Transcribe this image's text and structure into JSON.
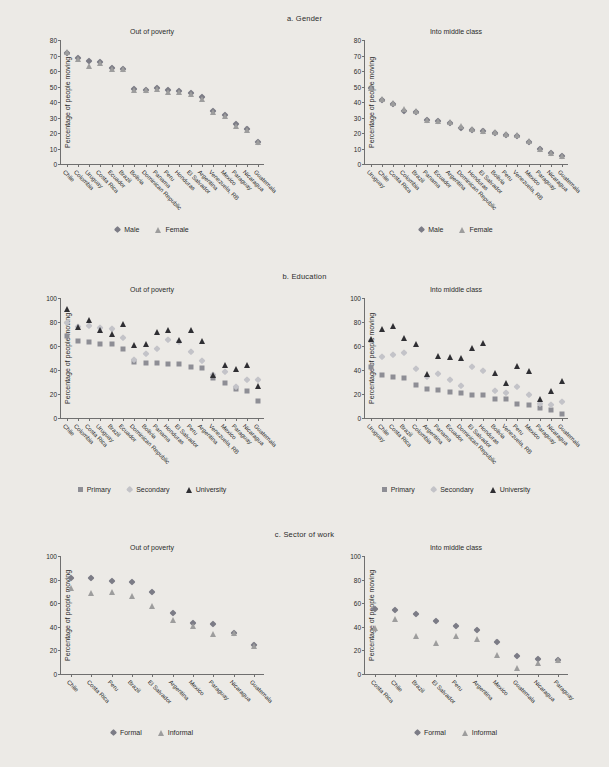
{
  "figure": {
    "background": "#eceae6",
    "marker_colors": {
      "male_diamond": "#7c7c86",
      "female_triangle": "#9d9d9d",
      "primary_square": "#8e8e95",
      "secondary_diamond": "#c3c3c8",
      "university_triangle": "#2f2f33",
      "formal_diamond": "#7c7c86",
      "informal_triangle": "#9d9d9d"
    }
  },
  "panels": [
    {
      "id": "a",
      "title": "a.  Gender",
      "legend": [
        {
          "label": "Male",
          "marker": "diamond"
        },
        {
          "label": "Female",
          "marker": "triangle"
        }
      ],
      "charts": [
        {
          "subtitle": "Out of poverty",
          "ylabel": "Percentage of people moving",
          "ylim": [
            0,
            80
          ],
          "yticks": [
            0,
            10,
            20,
            30,
            40,
            50,
            60,
            70,
            80
          ],
          "categories": [
            "Chile",
            "Colombia",
            "Uruguay",
            "Costa Rica",
            "Ecuador",
            "Brazil",
            "Bolivia",
            "Dominican Republic",
            "Panama",
            "Peru",
            "Honduras",
            "El Salvador",
            "Argentina",
            "Venezuela, RB",
            "Mexico",
            "Paraguay",
            "Nicaragua",
            "Guatemala"
          ],
          "series": [
            {
              "name": "Male",
              "marker": "diamond",
              "values": [
                71.5,
                68.5,
                66.5,
                65.5,
                62.0,
                61.5,
                48.5,
                48.0,
                49.0,
                47.5,
                47.0,
                45.5,
                43.0,
                34.0,
                31.5,
                26.0,
                22.5,
                14.5
              ]
            },
            {
              "name": "Female",
              "marker": "triangle",
              "values": [
                72.5,
                68.0,
                63.0,
                65.0,
                61.5,
                61.0,
                48.0,
                47.5,
                48.5,
                46.5,
                46.5,
                45.0,
                42.0,
                33.5,
                31.0,
                24.5,
                22.0,
                14.0
              ]
            }
          ]
        },
        {
          "subtitle": "Into middle class",
          "ylabel": "Percentage of people moving",
          "ylim": [
            0,
            80
          ],
          "yticks": [
            0,
            10,
            20,
            30,
            40,
            50,
            60,
            70,
            80
          ],
          "categories": [
            "Uruguay",
            "Chile",
            "Costa Rica",
            "Colombia",
            "Brazil",
            "Panama",
            "Ecuador",
            "Argentina",
            "Dominican Republic",
            "Honduras",
            "El Salvador",
            "Bolivia",
            "Peru",
            "Venezuela, RB",
            "Mexico",
            "Paraguay",
            "Nicaragua",
            "Guatemala"
          ],
          "series": [
            {
              "name": "Male",
              "marker": "diamond",
              "values": [
                49.0,
                41.5,
                39.0,
                34.5,
                33.5,
                28.5,
                27.5,
                26.5,
                23.5,
                22.0,
                21.0,
                20.0,
                19.0,
                18.0,
                14.5,
                9.5,
                7.0,
                5.0
              ]
            },
            {
              "name": "Female",
              "marker": "triangle",
              "values": [
                49.0,
                42.0,
                39.5,
                35.5,
                34.0,
                28.5,
                28.0,
                27.0,
                24.5,
                22.5,
                21.0,
                20.5,
                19.5,
                18.5,
                15.0,
                9.5,
                7.0,
                5.0
              ]
            }
          ]
        }
      ]
    },
    {
      "id": "b",
      "title": "b.  Education",
      "legend": [
        {
          "label": "Primary",
          "marker": "square"
        },
        {
          "label": "Secondary",
          "marker": "diamond-light"
        },
        {
          "label": "University",
          "marker": "triangle-dark"
        }
      ],
      "charts": [
        {
          "subtitle": "Out of poverty",
          "ylabel": "Percentage of people moving",
          "ylim": [
            0,
            100
          ],
          "yticks": [
            0,
            20,
            40,
            60,
            80,
            100
          ],
          "categories": [
            "Chile",
            "Colombia",
            "Costa Rica",
            "Uruguay",
            "Brazil",
            "Ecuador",
            "Dominican Republic",
            "Bolivia",
            "Panama",
            "Honduras",
            "El Salvador",
            "Peru",
            "Argentina",
            "Venezuela, RB",
            "Mexico",
            "Paraguay",
            "Nicaragua",
            "Guatemala"
          ],
          "series": [
            {
              "name": "Primary",
              "marker": "square",
              "values": [
                68.0,
                64.5,
                63.5,
                62.0,
                62.0,
                57.5,
                46.5,
                45.5,
                45.5,
                45.0,
                45.0,
                42.5,
                41.5,
                33.0,
                29.5,
                24.5,
                22.5,
                14.5
              ]
            },
            {
              "name": "Secondary",
              "marker": "diamond-light",
              "values": [
                79.0,
                75.5,
                76.5,
                75.0,
                74.0,
                67.0,
                48.5,
                53.0,
                57.5,
                65.0,
                63.0,
                55.0,
                47.5,
                35.5,
                38.5,
                26.0,
                31.5,
                32.0
              ]
            },
            {
              "name": "University",
              "marker": "triangle-dark",
              "values": [
                90.5,
                75.5,
                81.5,
                73.5,
                70.0,
                78.0,
                60.5,
                61.5,
                71.5,
                73.5,
                65.0,
                73.0,
                64.0,
                36.0,
                44.0,
                40.5,
                44.0,
                26.5
              ]
            }
          ]
        },
        {
          "subtitle": "Into middle class",
          "ylabel": "Percentage of people moving",
          "ylim": [
            0,
            100
          ],
          "yticks": [
            0,
            20,
            40,
            60,
            80,
            100
          ],
          "categories": [
            "Uruguay",
            "Chile",
            "Costa Rica",
            "Brazil",
            "Colombia",
            "Argentina",
            "Panama",
            "Ecuador",
            "Dominican Republic",
            "El Salvador",
            "Honduras",
            "Bolivia",
            "Venezuela, RB",
            "Peru",
            "Mexico",
            "Paraguay",
            "Nicaragua",
            "Guatemala"
          ],
          "series": [
            {
              "name": "Primary",
              "marker": "square",
              "values": [
                42.5,
                35.5,
                34.5,
                33.0,
                27.5,
                24.0,
                23.5,
                22.0,
                20.5,
                19.5,
                19.0,
                16.0,
                15.5,
                12.0,
                11.0,
                8.0,
                6.5,
                3.5
              ]
            },
            {
              "name": "Secondary",
              "marker": "diamond-light",
              "values": [
                64.0,
                51.0,
                52.5,
                54.5,
                40.5,
                34.0,
                36.5,
                31.5,
                26.5,
                42.5,
                39.5,
                22.5,
                21.0,
                25.5,
                19.0,
                12.0,
                10.5,
                13.5
              ]
            },
            {
              "name": "University",
              "marker": "triangle-dark",
              "values": [
                65.5,
                74.0,
                77.0,
                66.5,
                61.5,
                36.5,
                51.5,
                51.0,
                50.0,
                58.5,
                62.5,
                37.5,
                29.0,
                43.0,
                39.5,
                16.0,
                22.5,
                30.5
              ]
            }
          ]
        }
      ]
    },
    {
      "id": "c",
      "title": "c.  Sector of work",
      "legend": [
        {
          "label": "Formal",
          "marker": "diamond"
        },
        {
          "label": "Informal",
          "marker": "triangle"
        }
      ],
      "charts": [
        {
          "subtitle": "Out of poverty",
          "ylabel": "Percentage of people moving",
          "ylim": [
            0,
            100
          ],
          "yticks": [
            0,
            20,
            40,
            60,
            80,
            100
          ],
          "categories": [
            "Chile",
            "Costa Rica",
            "Peru",
            "Brazil",
            "El Salvador",
            "Argentina",
            "Mexico",
            "Paraguay",
            "Nicaragua",
            "Guatemala"
          ],
          "series": [
            {
              "name": "Formal",
              "marker": "diamond",
              "values": [
                81.5,
                81.5,
                79.0,
                78.0,
                69.5,
                52.0,
                43.5,
                42.5,
                34.5,
                25.0
              ]
            },
            {
              "name": "Informal",
              "marker": "triangle",
              "values": [
                72.5,
                69.0,
                69.5,
                66.5,
                58.0,
                45.5,
                40.5,
                33.5,
                34.5,
                23.5
              ]
            }
          ]
        },
        {
          "subtitle": "Into middle class",
          "ylabel": "Percentage of people moving",
          "ylim": [
            0,
            100
          ],
          "yticks": [
            0,
            20,
            40,
            60,
            80,
            100
          ],
          "categories": [
            "Costa Rica",
            "Chile",
            "Brazil",
            "El Salvador",
            "Peru",
            "Argentina",
            "Mexico",
            "Guatemala",
            "Nicaragua",
            "Paraguay"
          ],
          "series": [
            {
              "name": "Formal",
              "marker": "diamond",
              "values": [
                55.5,
                54.0,
                51.0,
                44.5,
                41.0,
                37.0,
                27.0,
                15.0,
                12.5,
                11.5
              ]
            },
            {
              "name": "Informal",
              "marker": "triangle",
              "values": [
                39.0,
                46.5,
                32.0,
                26.5,
                32.0,
                29.5,
                16.5,
                5.5,
                9.5,
                11.5
              ]
            }
          ]
        }
      ]
    }
  ],
  "chart_data": {
    "type": "scatter",
    "ylabel": "Percentage of people moving",
    "panels": [
      "a.  Gender",
      "b.  Education",
      "c.  Sector of work"
    ],
    "columns": [
      "Out of poverty",
      "Into middle class"
    ],
    "grid": false,
    "legend_position": "bottom-center",
    "a_gender": {
      "out_of_poverty": {
        "categories": [
          "Chile",
          "Colombia",
          "Uruguay",
          "Costa Rica",
          "Ecuador",
          "Brazil",
          "Bolivia",
          "Dominican Republic",
          "Panama",
          "Peru",
          "Honduras",
          "El Salvador",
          "Argentina",
          "Venezuela, RB",
          "Mexico",
          "Paraguay",
          "Nicaragua",
          "Guatemala"
        ],
        "ylim": [
          0,
          80
        ],
        "Male": [
          71.5,
          68.5,
          66.5,
          65.5,
          62.0,
          61.5,
          48.5,
          48.0,
          49.0,
          47.5,
          47.0,
          45.5,
          43.0,
          34.0,
          31.5,
          26.0,
          22.5,
          14.5
        ],
        "Female": [
          72.5,
          68.0,
          63.0,
          65.0,
          61.5,
          61.0,
          48.0,
          47.5,
          48.5,
          46.5,
          46.5,
          45.0,
          42.0,
          33.5,
          31.0,
          24.5,
          22.0,
          14.0
        ]
      },
      "into_middle_class": {
        "categories": [
          "Uruguay",
          "Chile",
          "Costa Rica",
          "Colombia",
          "Brazil",
          "Panama",
          "Ecuador",
          "Argentina",
          "Dominican Republic",
          "Honduras",
          "El Salvador",
          "Bolivia",
          "Peru",
          "Venezuela, RB",
          "Mexico",
          "Paraguay",
          "Nicaragua",
          "Guatemala"
        ],
        "ylim": [
          0,
          80
        ],
        "Male": [
          49.0,
          41.5,
          39.0,
          34.5,
          33.5,
          28.5,
          27.5,
          26.5,
          23.5,
          22.0,
          21.0,
          20.0,
          19.0,
          18.0,
          14.5,
          9.5,
          7.0,
          5.0
        ],
        "Female": [
          49.0,
          42.0,
          39.5,
          35.5,
          34.0,
          28.5,
          28.0,
          27.0,
          24.5,
          22.5,
          21.0,
          20.5,
          19.5,
          18.5,
          15.0,
          9.5,
          7.0,
          5.0
        ]
      }
    },
    "b_education": {
      "out_of_poverty": {
        "categories": [
          "Chile",
          "Colombia",
          "Costa Rica",
          "Uruguay",
          "Brazil",
          "Ecuador",
          "Dominican Republic",
          "Bolivia",
          "Panama",
          "Honduras",
          "El Salvador",
          "Peru",
          "Argentina",
          "Venezuela, RB",
          "Mexico",
          "Paraguay",
          "Nicaragua",
          "Guatemala"
        ],
        "ylim": [
          0,
          100
        ],
        "Primary": [
          68.0,
          64.5,
          63.5,
          62.0,
          62.0,
          57.5,
          46.5,
          45.5,
          45.5,
          45.0,
          45.0,
          42.5,
          41.5,
          33.0,
          29.5,
          24.5,
          22.5,
          14.5
        ],
        "Secondary": [
          79.0,
          75.5,
          76.5,
          75.0,
          74.0,
          67.0,
          48.5,
          53.0,
          57.5,
          65.0,
          63.0,
          55.0,
          47.5,
          35.5,
          38.5,
          26.0,
          31.5,
          32.0
        ],
        "University": [
          90.5,
          75.5,
          81.5,
          73.5,
          70.0,
          78.0,
          60.5,
          61.5,
          71.5,
          73.5,
          65.0,
          73.0,
          64.0,
          36.0,
          44.0,
          40.5,
          44.0,
          26.5
        ]
      },
      "into_middle_class": {
        "categories": [
          "Uruguay",
          "Chile",
          "Costa Rica",
          "Brazil",
          "Colombia",
          "Argentina",
          "Panama",
          "Ecuador",
          "Dominican Republic",
          "El Salvador",
          "Honduras",
          "Bolivia",
          "Venezuela, RB",
          "Peru",
          "Mexico",
          "Paraguay",
          "Nicaragua",
          "Guatemala"
        ],
        "ylim": [
          0,
          100
        ],
        "Primary": [
          42.5,
          35.5,
          34.5,
          33.0,
          27.5,
          24.0,
          23.5,
          22.0,
          20.5,
          19.5,
          19.0,
          16.0,
          15.5,
          12.0,
          11.0,
          8.0,
          6.5,
          3.5
        ],
        "Secondary": [
          64.0,
          51.0,
          52.5,
          54.5,
          40.5,
          34.0,
          36.5,
          31.5,
          26.5,
          42.5,
          39.5,
          22.5,
          21.0,
          25.5,
          19.0,
          12.0,
          10.5,
          13.5
        ],
        "University": [
          65.5,
          74.0,
          77.0,
          66.5,
          61.5,
          36.5,
          51.5,
          51.0,
          50.0,
          58.5,
          62.5,
          37.5,
          29.0,
          43.0,
          39.5,
          16.0,
          22.5,
          30.5
        ]
      }
    },
    "c_sector_of_work": {
      "out_of_poverty": {
        "categories": [
          "Chile",
          "Costa Rica",
          "Peru",
          "Brazil",
          "El Salvador",
          "Argentina",
          "Mexico",
          "Paraguay",
          "Nicaragua",
          "Guatemala"
        ],
        "ylim": [
          0,
          100
        ],
        "Formal": [
          81.5,
          81.5,
          79.0,
          78.0,
          69.5,
          52.0,
          43.5,
          42.5,
          34.5,
          25.0
        ],
        "Informal": [
          72.5,
          69.0,
          69.5,
          66.5,
          58.0,
          45.5,
          40.5,
          33.5,
          34.5,
          23.5
        ]
      },
      "into_middle_class": {
        "categories": [
          "Costa Rica",
          "Chile",
          "Brazil",
          "El Salvador",
          "Peru",
          "Argentina",
          "Mexico",
          "Guatemala",
          "Nicaragua",
          "Paraguay"
        ],
        "ylim": [
          0,
          100
        ],
        "Formal": [
          55.5,
          54.0,
          51.0,
          44.5,
          41.0,
          37.0,
          27.0,
          15.0,
          12.5,
          11.5
        ],
        "Informal": [
          39.0,
          46.5,
          32.0,
          26.5,
          32.0,
          29.5,
          16.5,
          5.5,
          9.5,
          11.5
        ]
      }
    }
  }
}
